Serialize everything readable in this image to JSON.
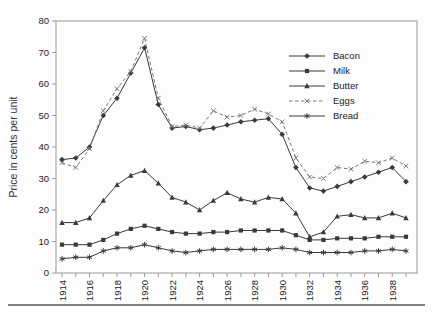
{
  "figure": {
    "ylabel": "Price in cents per unit"
  },
  "chart_data": {
    "type": "line",
    "title": "",
    "xlabel": "",
    "ylabel": "Price in cents per unit",
    "ylim": [
      0,
      80
    ],
    "ytick_step": 10,
    "xtick_label_every": 2,
    "grid": false,
    "legend_position": "upper-right-inside",
    "x": [
      1914,
      1915,
      1916,
      1917,
      1918,
      1919,
      1920,
      1921,
      1922,
      1923,
      1924,
      1925,
      1926,
      1927,
      1928,
      1929,
      1930,
      1931,
      1932,
      1933,
      1934,
      1935,
      1936,
      1937,
      1938,
      1939
    ],
    "xtick_labels": [
      "1914",
      "1916",
      "1918",
      "1920",
      "1922",
      "1924",
      "1926",
      "1928",
      "1930",
      "1932",
      "1934",
      "1936",
      "1938"
    ],
    "ytick_labels": [
      "0",
      "10",
      "20",
      "30",
      "40",
      "50",
      "60",
      "70",
      "80"
    ],
    "series": [
      {
        "name": "Bacon",
        "marker": "diamond",
        "line": "solid",
        "color": "#3a3a3a",
        "values": [
          36,
          36.5,
          40,
          50,
          55.5,
          63.5,
          71.5,
          53.5,
          46,
          46.5,
          45.5,
          46,
          47,
          48,
          48.5,
          49,
          44,
          33.5,
          27,
          26,
          27.5,
          29,
          30.5,
          32,
          33.5,
          29
        ]
      },
      {
        "name": "Milk",
        "marker": "square",
        "line": "solid",
        "color": "#3a3a3a",
        "values": [
          9,
          9,
          9,
          10.5,
          12.5,
          14,
          15,
          14,
          13,
          12.5,
          12.5,
          13,
          13,
          13.5,
          13.5,
          13.5,
          13.5,
          12,
          10.5,
          10.5,
          11,
          11,
          11,
          11.5,
          11.5,
          11.5
        ]
      },
      {
        "name": "Butter",
        "marker": "triangle",
        "line": "solid",
        "color": "#3a3a3a",
        "values": [
          16,
          16,
          17.5,
          23,
          28,
          31,
          32.5,
          28.5,
          24,
          22.5,
          20,
          23,
          25.5,
          23.5,
          22.5,
          24,
          23.5,
          19,
          11.5,
          13,
          18,
          18.5,
          17.5,
          17.5,
          19,
          17.5
        ]
      },
      {
        "name": "Eggs",
        "marker": "x",
        "line": "dashed",
        "color": "#787878",
        "values": [
          35,
          33.5,
          39.5,
          51.5,
          58.5,
          64,
          74.5,
          55.5,
          46.5,
          47,
          46,
          51.5,
          49.5,
          50,
          52,
          50.5,
          48,
          36.5,
          30.5,
          30,
          33.5,
          33,
          35.5,
          35,
          36.5,
          34
        ]
      },
      {
        "name": "Bread",
        "marker": "star",
        "line": "solid",
        "color": "#3a3a3a",
        "values": [
          4.5,
          5,
          5,
          7,
          8,
          8,
          9,
          8,
          7,
          6.5,
          7,
          7.5,
          7.5,
          7.5,
          7.5,
          7.5,
          8,
          7.5,
          6.5,
          6.5,
          6.5,
          6.5,
          7,
          7,
          7.5,
          7
        ]
      }
    ],
    "axis_color": "#9a9a9a",
    "text_color": "#222222",
    "bottom_rule_color": "#555555"
  }
}
